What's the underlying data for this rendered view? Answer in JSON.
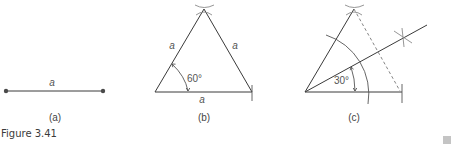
{
  "figure": {
    "caption": "Figure 3.41",
    "colors": {
      "line": "#3a3a3a",
      "text": "#555555",
      "construction": "#8a8a8a",
      "marker": "#c4c4c4"
    }
  },
  "panels": [
    {
      "id": "a",
      "label": "(a)",
      "segment_label": "a"
    },
    {
      "id": "b",
      "label": "(b)",
      "side_labels": [
        "a",
        "a",
        "a"
      ],
      "angle_label": "60°"
    },
    {
      "id": "c",
      "label": "(c)",
      "angle_label": "30°"
    }
  ]
}
